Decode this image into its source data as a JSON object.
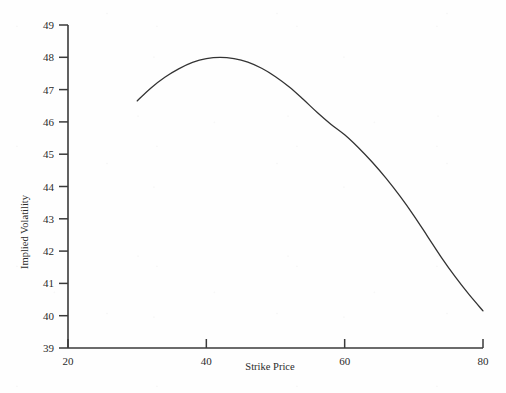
{
  "chart_data": {
    "type": "line",
    "title": "",
    "xlabel": "Strike Price",
    "ylabel": "Implied Volatility",
    "xlim": [
      20,
      80
    ],
    "ylim": [
      39,
      49
    ],
    "xticks": [
      20,
      40,
      60,
      80
    ],
    "yticks": [
      39,
      40,
      41,
      42,
      43,
      44,
      45,
      46,
      47,
      48,
      49
    ],
    "xtick_labels": [
      "20",
      "40",
      "60",
      "80"
    ],
    "ytick_labels": [
      "39",
      "40",
      "41",
      "42",
      "43",
      "44",
      "45",
      "46",
      "47",
      "48",
      "49"
    ],
    "grid": false,
    "legend": false,
    "legend_position": "none",
    "series": [
      {
        "name": "Implied Volatility Smile",
        "color": "#333333",
        "x": [
          30,
          32,
          34,
          36,
          38,
          40,
          42,
          44,
          46,
          48,
          50,
          52,
          54,
          56,
          58,
          60,
          62,
          64,
          66,
          68,
          70,
          72,
          74,
          76,
          78,
          80
        ],
        "y": [
          46.65,
          47.05,
          47.38,
          47.64,
          47.84,
          47.96,
          48.0,
          47.96,
          47.85,
          47.66,
          47.4,
          47.08,
          46.7,
          46.3,
          45.93,
          45.6,
          45.2,
          44.75,
          44.25,
          43.7,
          43.1,
          42.45,
          41.8,
          41.2,
          40.65,
          40.15
        ]
      }
    ],
    "annotations": []
  },
  "axis_titles": {
    "x": "Strike Price",
    "y": "Implied Volatility"
  }
}
